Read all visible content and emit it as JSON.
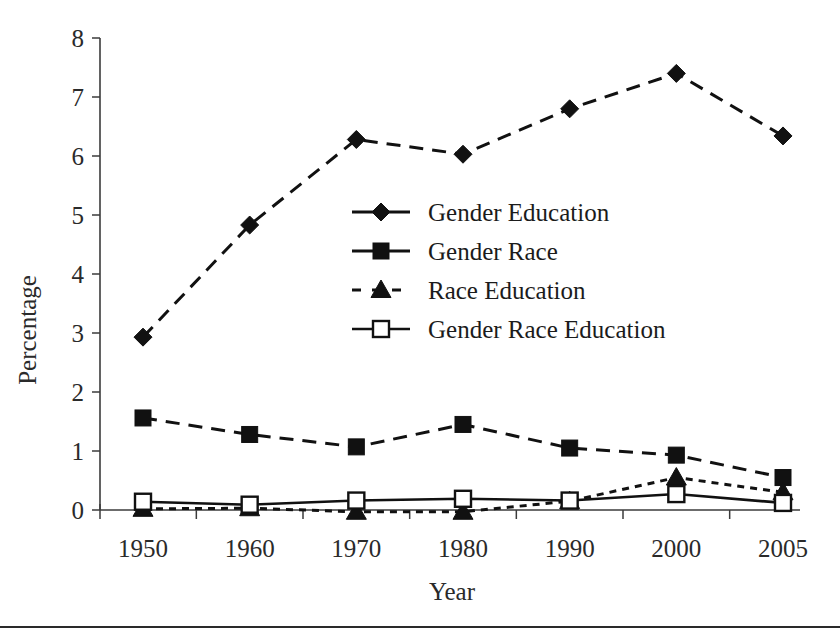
{
  "figure": {
    "background": "#ffffff",
    "ink_color": "#111111",
    "axis_color": "#3b3b3b"
  },
  "axes": {
    "y_title": "Percentage",
    "x_title": "Year",
    "y_ticks": [
      "0",
      "1",
      "2",
      "3",
      "4",
      "5",
      "6",
      "7",
      "8"
    ],
    "x_ticks": [
      "1950",
      "1960",
      "1970",
      "1980",
      "1990",
      "2000",
      "2005"
    ]
  },
  "legend": {
    "position": "center",
    "entries": [
      {
        "label": "Gender Education",
        "marker": "filled-diamond",
        "line": "dashed"
      },
      {
        "label": "Gender Race",
        "marker": "filled-square",
        "line": "dashed"
      },
      {
        "label": "Race Education",
        "marker": "filled-triangle",
        "line": "short-dashed"
      },
      {
        "label": "Gender Race Education",
        "marker": "open-square",
        "line": "solid"
      }
    ]
  },
  "chart_data": {
    "type": "line",
    "title": "",
    "xlabel": "Year",
    "ylabel": "Percentage",
    "categories": [
      "1950",
      "1960",
      "1970",
      "1980",
      "1990",
      "2000",
      "2005"
    ],
    "x": [
      1950,
      1960,
      1970,
      1980,
      1990,
      2000,
      2005
    ],
    "ylim": [
      0,
      8
    ],
    "xlim": [
      1950,
      2005
    ],
    "grid": false,
    "legend_position": "center",
    "series": [
      {
        "name": "Gender Education",
        "marker": "filled-diamond",
        "linestyle": "dashed",
        "color": "#111111",
        "values": [
          2.93,
          4.83,
          6.28,
          6.03,
          6.8,
          7.4,
          6.34
        ]
      },
      {
        "name": "Gender Race",
        "marker": "filled-square",
        "linestyle": "dashed",
        "color": "#111111",
        "values": [
          1.56,
          1.28,
          1.07,
          1.45,
          1.05,
          0.93,
          0.55
        ]
      },
      {
        "name": "Race Education",
        "marker": "filled-triangle",
        "linestyle": "short-dashed",
        "color": "#111111",
        "values": [
          0.02,
          0.03,
          -0.03,
          -0.03,
          0.15,
          0.55,
          0.3
        ]
      },
      {
        "name": "Gender Race Education",
        "marker": "open-square",
        "linestyle": "solid",
        "color": "#111111",
        "values": [
          0.14,
          0.09,
          0.16,
          0.19,
          0.16,
          0.27,
          0.12
        ]
      }
    ]
  }
}
